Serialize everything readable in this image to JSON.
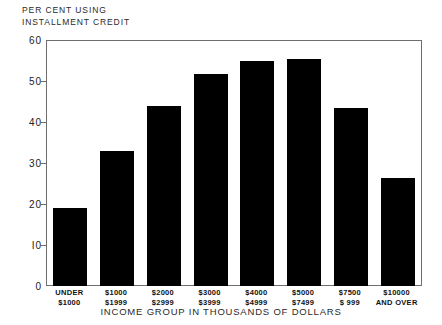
{
  "chart_data": {
    "type": "bar",
    "title_lines": [
      "PER CENT USING",
      "INSTALLMENT CREDIT"
    ],
    "xlabel": "INCOME GROUP IN THOUSANDS OF DOLLARS",
    "ylabel": "PER CENT USING INSTALLMENT CREDIT",
    "ylim": [
      0,
      60
    ],
    "yticks": [
      0,
      10,
      20,
      30,
      40,
      50,
      60
    ],
    "ytick_labels": [
      "0",
      "I0",
      "20",
      "30",
      "40",
      "50",
      "60"
    ],
    "grid": false,
    "legend": "none",
    "bar_color": "#000000",
    "categories": [
      "UNDER\n$1000",
      "$1000\n$1999",
      "$2000\n$2999",
      "$3000\n$3999",
      "$4000\n$4999",
      "$5000\n$7499",
      "$7500\n$ 999",
      "$10000\nAND OVER"
    ],
    "category_lines": [
      [
        "UNDER",
        "$1000"
      ],
      [
        "$1000",
        "$1999"
      ],
      [
        "$2000",
        "$2999"
      ],
      [
        "$3000",
        "$3999"
      ],
      [
        "$4000",
        "$4999"
      ],
      [
        "$5000",
        "$7499"
      ],
      [
        "$7500",
        "$ 999"
      ],
      [
        "$10000",
        "AND OVER"
      ]
    ],
    "values": [
      19,
      33,
      44,
      52,
      55,
      55.5,
      43.5,
      26.5
    ]
  },
  "axis": {
    "frame_color": "#6e6e6e"
  }
}
